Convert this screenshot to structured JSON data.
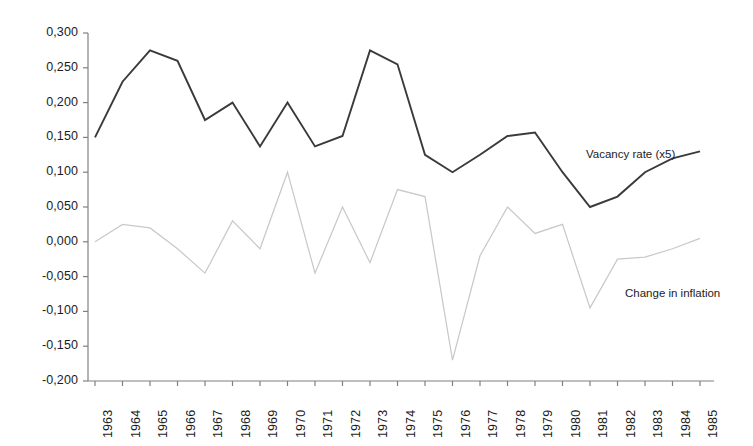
{
  "chart_data": {
    "type": "line",
    "title": "",
    "subtitle": "",
    "xlabel": "",
    "ylabel": "",
    "x": [
      "1963",
      "1964",
      "1965",
      "1966",
      "1967",
      "1968",
      "1969",
      "1970",
      "1971",
      "1972",
      "1973",
      "1974",
      "1975",
      "1976",
      "1977",
      "1978",
      "1979",
      "1980",
      "1981",
      "1982",
      "1983",
      "1984",
      "1985"
    ],
    "categories": [
      "1963",
      "1964",
      "1965",
      "1966",
      "1967",
      "1968",
      "1969",
      "1970",
      "1971",
      "1972",
      "1973",
      "1974",
      "1975",
      "1976",
      "1977",
      "1978",
      "1979",
      "1980",
      "1981",
      "1982",
      "1983",
      "1984",
      "1985"
    ],
    "ylim": [
      -0.2,
      0.3
    ],
    "ytick_values": [
      0.3,
      0.25,
      0.2,
      0.15,
      0.1,
      0.05,
      0.0,
      -0.05,
      -0.1,
      -0.15,
      -0.2
    ],
    "ytick_labels": [
      "0,300",
      "0,250",
      "0,200",
      "0,150",
      "0,100",
      "0,050",
      "0,000",
      "-0,050",
      "-0,100",
      "-0,150",
      "-0,200"
    ],
    "decimal_separator": ",",
    "grid": false,
    "legend_position": "inline-annotation",
    "series": [
      {
        "name": "Vacancy rate (x5)",
        "color": "#3a3a3a",
        "label_x": "1980",
        "values": [
          0.15,
          0.23,
          0.275,
          0.26,
          0.175,
          0.2,
          0.137,
          0.2,
          0.137,
          0.152,
          0.275,
          0.255,
          0.125,
          0.1,
          0.125,
          0.152,
          0.157,
          0.1,
          0.05,
          0.065,
          0.1,
          0.12,
          0.13
        ]
      },
      {
        "name": "Change in inflation",
        "color": "#c9c9c9",
        "label_x": "1982",
        "values": [
          0.0,
          0.025,
          0.02,
          -0.01,
          -0.045,
          0.03,
          -0.01,
          0.1,
          -0.045,
          0.05,
          -0.03,
          0.075,
          0.065,
          -0.17,
          -0.02,
          0.05,
          0.012,
          0.025,
          -0.095,
          -0.025,
          -0.022,
          -0.01,
          0.005
        ]
      }
    ]
  },
  "axis": {
    "x_axis_name": "year-axis",
    "y_axis_name": "value-axis"
  }
}
